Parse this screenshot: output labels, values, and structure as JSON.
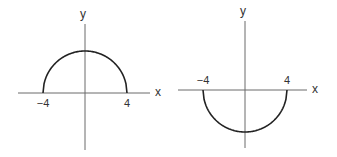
{
  "chart_data": [
    {
      "type": "line",
      "title": "",
      "description": "Upper semicircle y = sqrt(16 - x^2)",
      "xlabel": "x",
      "ylabel": "y",
      "xlim": [
        -6.5,
        6.5
      ],
      "ylim": [
        -6,
        6
      ],
      "tick_labels": [
        {
          "x": -4,
          "text": "−4"
        },
        {
          "x": 4,
          "text": "4"
        }
      ],
      "series": [
        {
          "name": "upper semicircle",
          "radius": 4,
          "direction": "upper",
          "x": [
            -4,
            -3,
            -2,
            -1,
            0,
            1,
            2,
            3,
            4
          ],
          "y": [
            0,
            2.65,
            3.46,
            3.87,
            4,
            3.87,
            3.46,
            2.65,
            0
          ]
        }
      ],
      "grid": false,
      "legend": "none"
    },
    {
      "type": "line",
      "title": "",
      "description": "Lower semicircle y = -sqrt(16 - x^2)",
      "xlabel": "x",
      "ylabel": "y",
      "xlim": [
        -6.5,
        6.5
      ],
      "ylim": [
        -6,
        6
      ],
      "tick_labels": [
        {
          "x": -4,
          "text": "−4"
        },
        {
          "x": 4,
          "text": "4"
        }
      ],
      "series": [
        {
          "name": "lower semicircle",
          "radius": 4,
          "direction": "lower",
          "x": [
            -4,
            -3,
            -2,
            -1,
            0,
            1,
            2,
            3,
            4
          ],
          "y": [
            0,
            -2.65,
            -3.46,
            -3.87,
            -4,
            -3.87,
            -3.46,
            -2.65,
            0
          ]
        }
      ],
      "grid": false,
      "legend": "none"
    }
  ]
}
